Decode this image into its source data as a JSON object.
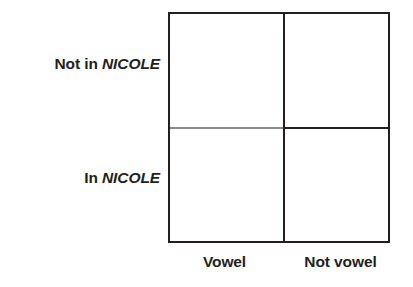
{
  "figure": {
    "type": "classification-matrix",
    "background_color": "#ffffff",
    "line_color": "#231f20",
    "light_line_color": "#8a8a8a",
    "text_color": "#231f20"
  },
  "rows": {
    "header_prefix_top": "Not in ",
    "header_term_top": "NICOLE",
    "header_prefix_bottom": "In ",
    "header_term_bottom": "NICOLE",
    "labels": [
      "Not in NICOLE",
      "In NICOLE"
    ]
  },
  "columns": {
    "label_left": "Vowel",
    "label_right": "Not vowel",
    "labels": [
      "Vowel",
      "Not vowel"
    ]
  },
  "cells": {
    "vowel_not_in_nicole": "",
    "not_vowel_not_in_nicole": "",
    "vowel_in_nicole": "",
    "not_vowel_in_nicole": ""
  }
}
